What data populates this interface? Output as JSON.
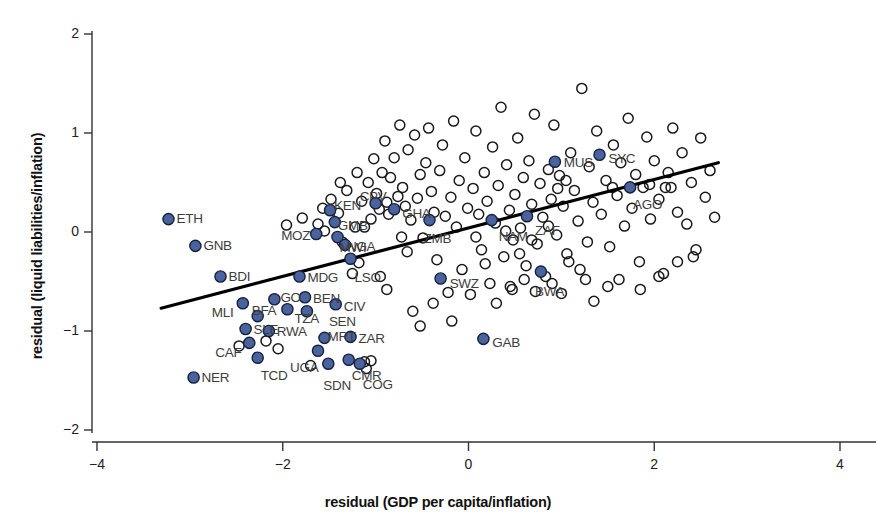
{
  "chart_data": {
    "type": "scatter",
    "title": "",
    "xlabel": "residual (GDP per capita/inflation)",
    "ylabel": "residual (liquid liabilities/inflation)",
    "xlim": [
      -4,
      4
    ],
    "ylim": [
      -2,
      2
    ],
    "xticks": [
      -4,
      -2,
      0,
      2,
      4
    ],
    "yticks": [
      -2,
      -1,
      0,
      1,
      2
    ],
    "xtick_labels": [
      "−4",
      "−2",
      "0",
      "2",
      "4"
    ],
    "ytick_labels": [
      "−2",
      "−1",
      "0",
      "1",
      "2"
    ],
    "grid": false,
    "legend": "none",
    "colors": {
      "highlight_fill": "#4a639c",
      "highlight_stroke": "#16213f",
      "plain_stroke": "#1a1a1a",
      "line": "#000000",
      "axis": "#333333",
      "label_text": "#3d3d3d"
    },
    "fit_line": {
      "x0": -3.31,
      "y0": -0.77,
      "x1": 2.69,
      "y1": 0.7,
      "slope": 0.245,
      "intercept": 0.041
    },
    "labeled_series": {
      "name": "Highlighted countries (filled)",
      "points": [
        {
          "code": "ETH",
          "x": -3.23,
          "y": 0.13,
          "lx": 8,
          "ly": -7
        },
        {
          "code": "GNB",
          "x": -2.94,
          "y": -0.14,
          "lx": 8,
          "ly": -7
        },
        {
          "code": "BDI",
          "x": -2.67,
          "y": -0.45,
          "lx": 8,
          "ly": -7
        },
        {
          "code": "MLI",
          "x": -2.43,
          "y": -0.72,
          "lx": -31,
          "ly": 3
        },
        {
          "code": "SLE",
          "x": -2.4,
          "y": -0.98,
          "lx": 8,
          "ly": -6
        },
        {
          "code": "CAF",
          "x": -2.36,
          "y": -1.12,
          "lx": -34,
          "ly": 3
        },
        {
          "code": "NER",
          "x": -2.96,
          "y": -1.47,
          "lx": 8,
          "ly": -7
        },
        {
          "code": "TCD",
          "x": -2.27,
          "y": -1.27,
          "lx": 3,
          "ly": 11
        },
        {
          "code": "BFA",
          "x": -2.27,
          "y": -0.85,
          "lx": -6,
          "ly": -12
        },
        {
          "code": "RWA",
          "x": -2.15,
          "y": -1.0,
          "lx": 8,
          "ly": -6
        },
        {
          "code": "GO",
          "x": -2.09,
          "y": -0.68,
          "lx": 6,
          "ly": -8
        },
        {
          "code": "TZA",
          "x": -1.95,
          "y": -0.78,
          "lx": 7,
          "ly": 3
        },
        {
          "code": "MDG",
          "x": -1.82,
          "y": -0.45,
          "lx": 8,
          "ly": -6
        },
        {
          "code": "UGA",
          "x": -1.62,
          "y": -1.2,
          "lx": -28,
          "ly": 10
        },
        {
          "code": "SDN",
          "x": -1.51,
          "y": -1.33,
          "lx": -5,
          "ly": 15
        },
        {
          "code": "MRT",
          "x": -1.55,
          "y": -1.07,
          "lx": 3,
          "ly": -8
        },
        {
          "code": "BEN",
          "x": -1.76,
          "y": -0.66,
          "lx": 8,
          "ly": -5
        },
        {
          "code": "SEN",
          "x": -1.74,
          "y": -0.8,
          "lx": 22,
          "ly": 4
        },
        {
          "code": "CIV",
          "x": -1.43,
          "y": -0.73,
          "lx": 8,
          "ly": -4
        },
        {
          "code": "MOZ",
          "x": -1.64,
          "y": -0.02,
          "lx": -35,
          "ly": -5
        },
        {
          "code": "KEN",
          "x": -1.49,
          "y": 0.22,
          "lx": 4,
          "ly": -11
        },
        {
          "code": "GMB",
          "x": -1.44,
          "y": 0.1,
          "lx": 3,
          "ly": -3
        },
        {
          "code": "MWI",
          "x": -1.41,
          "y": -0.05,
          "lx": 2,
          "ly": 4
        },
        {
          "code": "ZAR",
          "x": -1.27,
          "y": -1.06,
          "lx": 8,
          "ly": -5
        },
        {
          "code": "CMR",
          "x": -1.29,
          "y": -1.29,
          "lx": 3,
          "ly": 9
        },
        {
          "code": "COG",
          "x": -1.17,
          "y": -1.33,
          "lx": 3,
          "ly": 14
        },
        {
          "code": "NGA",
          "x": -1.33,
          "y": -0.13,
          "lx": 2,
          "ly": -5
        },
        {
          "code": "LSO",
          "x": -1.27,
          "y": -0.27,
          "lx": 4,
          "ly": 12
        },
        {
          "code": "CPV",
          "x": -1.0,
          "y": 0.29,
          "lx": -16,
          "ly": -13
        },
        {
          "code": "GHA",
          "x": -0.8,
          "y": 0.23,
          "lx": 8,
          "ly": -2
        },
        {
          "code": "ZMB",
          "x": -0.42,
          "y": 0.12,
          "lx": -6,
          "ly": 12
        },
        {
          "code": "SWZ",
          "x": -0.3,
          "y": -0.47,
          "lx": 9,
          "ly": -2
        },
        {
          "code": "GAB",
          "x": 0.16,
          "y": -1.08,
          "lx": 9,
          "ly": -3
        },
        {
          "code": "NAM",
          "x": 0.25,
          "y": 0.12,
          "lx": 7,
          "ly": 10
        },
        {
          "code": "ZAF",
          "x": 0.63,
          "y": 0.16,
          "lx": 8,
          "ly": 8
        },
        {
          "code": "BWA",
          "x": 0.78,
          "y": -0.4,
          "lx": -6,
          "ly": 13
        },
        {
          "code": "MUS",
          "x": 0.93,
          "y": 0.71,
          "lx": 9,
          "ly": -6
        },
        {
          "code": "SYC",
          "x": 1.41,
          "y": 0.78,
          "lx": 9,
          "ly": -3
        },
        {
          "code": "AGO",
          "x": 1.74,
          "y": 0.45,
          "lx": 3,
          "ly": 11
        }
      ]
    },
    "background_series": {
      "name": "Other observations (open circles)",
      "points": [
        [
          -2.47,
          -1.15
        ],
        [
          -2.18,
          -1.1
        ],
        [
          -1.96,
          0.07
        ],
        [
          -1.79,
          0.14
        ],
        [
          -1.62,
          0.08
        ],
        [
          -1.57,
          0.24
        ],
        [
          -1.55,
          0.01
        ],
        [
          -1.48,
          0.33
        ],
        [
          -1.4,
          0.19
        ],
        [
          -1.36,
          -0.1
        ],
        [
          -1.31,
          0.42
        ],
        [
          -1.25,
          -0.42
        ],
        [
          -1.22,
          0.05
        ],
        [
          -1.2,
          0.6
        ],
        [
          -1.18,
          -0.31
        ],
        [
          -1.15,
          0.31
        ],
        [
          -1.12,
          -1.31
        ],
        [
          -1.08,
          0.5
        ],
        [
          -1.05,
          0.13
        ],
        [
          -1.02,
          0.74
        ],
        [
          -0.99,
          0.39
        ],
        [
          -0.96,
          0.23
        ],
        [
          -0.93,
          0.6
        ],
        [
          -0.9,
          0.92
        ],
        [
          -0.88,
          0.3
        ],
        [
          -0.86,
          0.18
        ],
        [
          -0.84,
          0.55
        ],
        [
          -0.8,
          0.75
        ],
        [
          -0.76,
          0.36
        ],
        [
          -0.74,
          1.08
        ],
        [
          -0.71,
          0.45
        ],
        [
          -0.68,
          0.26
        ],
        [
          -0.65,
          0.83
        ],
        [
          -0.62,
          0.12
        ],
        [
          -0.58,
          0.98
        ],
        [
          -0.55,
          0.34
        ],
        [
          -0.52,
          0.58
        ],
        [
          -0.49,
          -0.06
        ],
        [
          -0.46,
          0.7
        ],
        [
          -0.43,
          1.05
        ],
        [
          -0.4,
          0.41
        ],
        [
          -0.37,
          0.2
        ],
        [
          -0.34,
          -0.28
        ],
        [
          -0.31,
          0.62
        ],
        [
          -0.28,
          0.88
        ],
        [
          -0.25,
          0.16
        ],
        [
          -0.22,
          -0.61
        ],
        [
          -0.19,
          0.35
        ],
        [
          -0.16,
          1.12
        ],
        [
          -0.13,
          0.05
        ],
        [
          -0.1,
          0.52
        ],
        [
          -0.07,
          -0.38
        ],
        [
          -0.04,
          0.75
        ],
        [
          -0.01,
          0.24
        ],
        [
          0.02,
          -0.63
        ],
        [
          0.05,
          0.44
        ],
        [
          0.08,
          1.02
        ],
        [
          0.11,
          0.18
        ],
        [
          0.14,
          -0.18
        ],
        [
          0.17,
          0.6
        ],
        [
          0.2,
          0.31
        ],
        [
          0.23,
          -0.52
        ],
        [
          0.26,
          0.86
        ],
        [
          0.29,
          0.09
        ],
        [
          0.32,
          0.47
        ],
        [
          0.35,
          1.26
        ],
        [
          0.38,
          -0.25
        ],
        [
          0.41,
          0.68
        ],
        [
          0.44,
          0.22
        ],
        [
          0.47,
          -0.58
        ],
        [
          0.5,
          0.38
        ],
        [
          0.53,
          0.95
        ],
        [
          0.56,
          0.04
        ],
        [
          0.59,
          0.55
        ],
        [
          0.62,
          -0.34
        ],
        [
          0.65,
          0.72
        ],
        [
          0.68,
          0.28
        ],
        [
          0.71,
          1.19
        ],
        [
          0.74,
          -0.12
        ],
        [
          0.77,
          0.49
        ],
        [
          0.8,
          0.15
        ],
        [
          0.83,
          -0.45
        ],
        [
          0.86,
          0.63
        ],
        [
          0.89,
          0.33
        ],
        [
          0.92,
          1.08
        ],
        [
          0.95,
          -0.03
        ],
        [
          0.98,
          0.57
        ],
        [
          1.02,
          0.26
        ],
        [
          1.06,
          -0.22
        ],
        [
          1.1,
          0.8
        ],
        [
          1.14,
          0.42
        ],
        [
          1.18,
          0.11
        ],
        [
          1.22,
          1.45
        ],
        [
          1.26,
          -0.48
        ],
        [
          1.3,
          0.66
        ],
        [
          1.34,
          0.3
        ],
        [
          1.38,
          1.02
        ],
        [
          1.43,
          0.18
        ],
        [
          1.48,
          0.52
        ],
        [
          1.52,
          -0.15
        ],
        [
          1.56,
          0.88
        ],
        [
          1.6,
          0.37
        ],
        [
          1.64,
          0.7
        ],
        [
          1.68,
          0.06
        ],
        [
          1.72,
          1.15
        ],
        [
          1.76,
          0.24
        ],
        [
          1.8,
          0.58
        ],
        [
          1.84,
          -0.3
        ],
        [
          1.88,
          0.45
        ],
        [
          1.92,
          0.96
        ],
        [
          1.96,
          0.13
        ],
        [
          2.0,
          0.72
        ],
        [
          2.05,
          0.33
        ],
        [
          2.1,
          -0.42
        ],
        [
          2.15,
          0.6
        ],
        [
          2.2,
          1.05
        ],
        [
          2.25,
          0.2
        ],
        [
          2.3,
          0.8
        ],
        [
          2.35,
          0.08
        ],
        [
          2.4,
          0.5
        ],
        [
          2.45,
          -0.18
        ],
        [
          2.5,
          0.95
        ],
        [
          2.55,
          0.35
        ],
        [
          2.6,
          0.62
        ],
        [
          2.65,
          0.15
        ],
        [
          -2.05,
          -1.18
        ],
        [
          -1.7,
          -1.35
        ],
        [
          -1.1,
          -1.38
        ],
        [
          -1.05,
          -1.3
        ],
        [
          -0.6,
          -0.8
        ],
        [
          -0.52,
          -0.95
        ],
        [
          -0.38,
          -0.72
        ],
        [
          -0.18,
          -0.9
        ],
        [
          0.3,
          -0.72
        ],
        [
          0.45,
          -0.55
        ],
        [
          0.6,
          -0.48
        ],
        [
          0.72,
          -0.6
        ],
        [
          0.9,
          -0.52
        ],
        [
          1.0,
          -0.62
        ],
        [
          1.2,
          -0.38
        ],
        [
          1.35,
          -0.7
        ],
        [
          1.5,
          -0.55
        ],
        [
          1.62,
          -0.48
        ],
        [
          1.85,
          -0.58
        ],
        [
          2.05,
          -0.45
        ],
        [
          2.25,
          -0.3
        ],
        [
          2.42,
          -0.25
        ],
        [
          -0.72,
          -0.05
        ],
        [
          -0.66,
          -0.2
        ],
        [
          -1.12,
          0.05
        ],
        [
          -1.38,
          0.5
        ],
        [
          -0.95,
          -0.45
        ],
        [
          -0.88,
          -0.58
        ],
        [
          0.08,
          -0.05
        ],
        [
          0.18,
          -0.32
        ],
        [
          0.55,
          -0.22
        ],
        [
          0.68,
          -0.08
        ],
        [
          1.08,
          -0.3
        ],
        [
          1.28,
          -0.1
        ],
        [
          1.55,
          0.45
        ],
        [
          1.95,
          0.48
        ],
        [
          2.12,
          0.45
        ],
        [
          2.18,
          0.45
        ],
        [
          0.4,
          0.01
        ],
        [
          0.48,
          -0.08
        ],
        [
          0.86,
          0.06
        ],
        [
          0.96,
          0.44
        ],
        [
          1.05,
          0.52
        ]
      ]
    }
  },
  "labels": {
    "x_axis_title": "residual (GDP per capita/inflation)",
    "y_axis_title": "residual (liquid liabilities/inflation)"
  }
}
